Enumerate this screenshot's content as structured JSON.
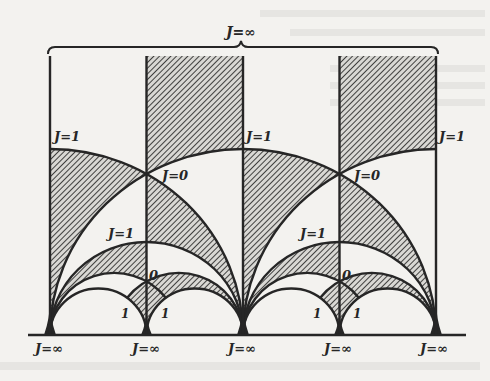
{
  "figure": {
    "title_label": "J=∞",
    "brace": {
      "x_start": 48,
      "x_end": 438,
      "y": 47,
      "peak_x": 241
    },
    "colors": {
      "ink": "#262626",
      "paper": "#f3f2ef",
      "hatch": "#2e2e2e"
    },
    "geometry": {
      "origin_x": 243,
      "baseline_y": 335,
      "unit_x": 193,
      "unit_y": 186,
      "top_y": 56,
      "vertical_lines_re": [
        -1,
        -0.5,
        0,
        0.5,
        1
      ],
      "strip_offsets": [
        0,
        193
      ]
    },
    "labels": {
      "upper_left_j1": "J=1",
      "upper_left_j0": "J=0",
      "upper_mid_j1": "J=1",
      "upper_right_j0": "J=0",
      "upper_right_j1": "J=1",
      "lower_left_j1": "J=1",
      "lower_right_j1": "J=1",
      "left_zero": "0",
      "right_zero": "0",
      "one_a": "1",
      "one_b": "1",
      "one_c": "1",
      "one_d": "1"
    },
    "cusp_labels": [
      "J=∞",
      "J=∞",
      "J=∞",
      "J=∞",
      "J=∞"
    ],
    "regions": {
      "shaded": [
        "fundamental-rect -1/2<Re<0 above |z|=1",
        "lune -1<Re<-1/2 between |z+1|=1 and |z|=1",
        "lune -1/2<Re<0 between |z+1|=1 and |z+1/2|=1/2",
        "band -1<Re<-1/2 between |z+1/2|=1/2 and |z+2/3|=1/3",
        "band -1/2<Re<0 between |z+1/3|=1/3 and |z+1/4|=1/4",
        "small triangle below J=0 point at Re=-1/2"
      ],
      "period": 1
    }
  }
}
